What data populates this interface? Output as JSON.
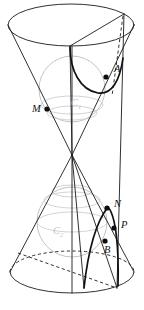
{
  "figure": {
    "canvas": {
      "width": 144,
      "height": 310,
      "background": "#ffffff"
    },
    "colors": {
      "outline": "#1a1a1a",
      "conic_curve": "#111111",
      "sphere": "#b9bcc2",
      "sphere_label": "#bfc2c7",
      "point": "#0d0d0d",
      "label": "#111111"
    },
    "labels": {
      "point_A": "A",
      "point_M": "M",
      "point_N": "N",
      "point_P": "P",
      "point_B": "B",
      "sphere_C1": "C",
      "sphere_C1_sub": "1",
      "sphere_C2": "C",
      "sphere_C2_sub": "2"
    },
    "points": [
      {
        "name": "A",
        "x": 106,
        "y": 77,
        "label_dx": 8,
        "label_dy": -5
      },
      {
        "name": "M",
        "x": 47,
        "y": 109,
        "label_dx": -13,
        "label_dy": 2
      },
      {
        "name": "N",
        "x": 107,
        "y": 208,
        "label_dx": 8,
        "label_dy": -1
      },
      {
        "name": "P",
        "x": 114,
        "y": 228,
        "label_dx": 8,
        "label_dy": -1
      },
      {
        "name": "B",
        "x": 105,
        "y": 241,
        "label_dx": 4,
        "label_dy": 10
      }
    ],
    "spheres": [
      {
        "name": "C1",
        "cx": 72,
        "cy": 89,
        "r": 33,
        "equator_ry": 9
      },
      {
        "name": "C2",
        "cx": 72,
        "cy": 222,
        "r": 35,
        "equator_ry": 10
      }
    ],
    "cones": {
      "apex": {
        "x": 72,
        "y": 155
      },
      "top_ellipse": {
        "cx": 71,
        "cy": 25,
        "rx": 63,
        "ry": 21
      },
      "bottom_ellipse": {
        "cx": 72,
        "cy": 272,
        "rx": 62,
        "ry": 21
      }
    },
    "elements": [
      "top-cone-outline",
      "bottom-cone-outline",
      "top-ellipse",
      "bottom-ellipse-front",
      "bottom-ellipse-back-dashed",
      "inscribed-sphere-upper",
      "inscribed-sphere-lower",
      "cutting-plane-edge",
      "vertical-axis",
      "dashed-generator",
      "conic-curve-upper",
      "conic-curve-lower"
    ]
  }
}
